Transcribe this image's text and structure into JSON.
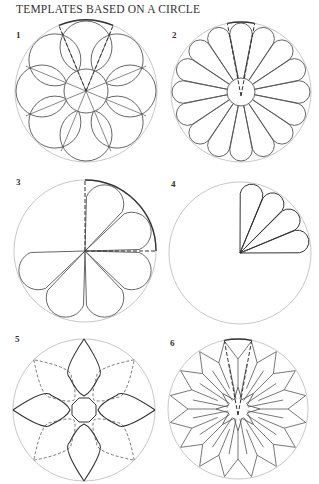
{
  "title": "TEMPLATES BASED ON A CIRCLE",
  "colors": {
    "guide": "#c8c8c8",
    "line": "#555555",
    "bold": "#333333"
  },
  "templates": [
    {
      "label": "1",
      "label_pos": [
        16,
        30
      ],
      "cx": 86,
      "cy": 91,
      "r": 71,
      "type": "petals8"
    },
    {
      "label": "2",
      "label_pos": [
        172,
        30
      ],
      "cx": 241,
      "cy": 92,
      "r": 70,
      "type": "petals16"
    },
    {
      "label": "3",
      "label_pos": [
        16,
        177
      ],
      "cx": 85,
      "cy": 251,
      "r": 71,
      "type": "partial6"
    },
    {
      "label": "4",
      "label_pos": [
        171,
        179
      ],
      "cx": 240,
      "cy": 253,
      "r": 71,
      "type": "partial4"
    },
    {
      "label": "5",
      "label_pos": [
        15,
        334
      ],
      "cx": 84,
      "cy": 410,
      "r": 71,
      "type": "star4"
    },
    {
      "label": "6",
      "label_pos": [
        170,
        338
      ],
      "cx": 238,
      "cy": 409,
      "r": 70,
      "type": "kites16"
    }
  ]
}
